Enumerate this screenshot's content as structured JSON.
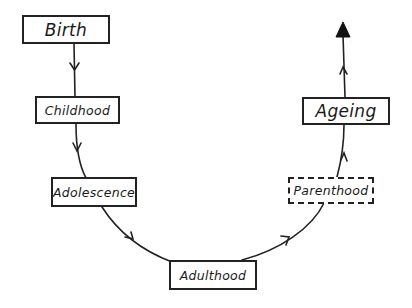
{
  "diagram": {
    "type": "life-cycle flow",
    "stages": [
      {
        "id": "birth",
        "label": "Birth",
        "style": "solid"
      },
      {
        "id": "childhood",
        "label": "Childhood",
        "style": "solid"
      },
      {
        "id": "adolescence",
        "label": "Adolescence",
        "style": "solid"
      },
      {
        "id": "adulthood",
        "label": "Adulthood",
        "style": "solid"
      },
      {
        "id": "parenthood",
        "label": "Parenthood",
        "style": "dashed"
      },
      {
        "id": "ageing",
        "label": "Ageing",
        "style": "solid"
      }
    ],
    "edges": [
      {
        "from": "birth",
        "to": "childhood"
      },
      {
        "from": "childhood",
        "to": "adolescence"
      },
      {
        "from": "adolescence",
        "to": "adulthood"
      },
      {
        "from": "adulthood",
        "to": "parenthood"
      },
      {
        "from": "parenthood",
        "to": "ageing"
      },
      {
        "from": "ageing",
        "to": "end-arrow"
      }
    ],
    "colors": {
      "stroke": "#222222",
      "background": "#ffffff"
    }
  }
}
